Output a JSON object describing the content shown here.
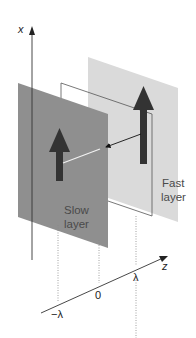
{
  "diagram": {
    "axes": {
      "x_label": "x",
      "z_label": "z",
      "z_ticks": [
        "−λ",
        "0",
        "λ"
      ]
    },
    "layers": [
      {
        "id": "slow",
        "label_line1": "Slow",
        "label_line2": "layer",
        "color": "#8c8c8c"
      },
      {
        "id": "middle",
        "label_line1": "",
        "label_line2": "",
        "color": "#ffffff"
      },
      {
        "id": "fast",
        "label_line1": "Fast",
        "label_line2": "layer",
        "color": "#d9d9d9"
      }
    ],
    "arrows": {
      "field_arrow_color": "#333333",
      "propagation_arrow_color": "#111111"
    }
  }
}
